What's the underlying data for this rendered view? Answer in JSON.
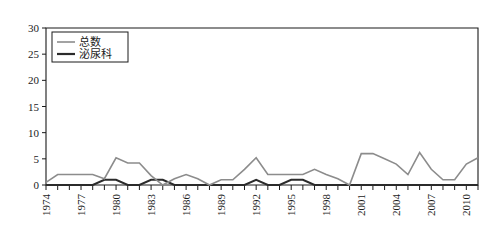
{
  "chart_data": {
    "type": "line",
    "title": "",
    "xlabel": "",
    "ylabel": "",
    "ylim": [
      0,
      30
    ],
    "ytick_values": [
      0,
      5,
      10,
      15,
      20,
      25,
      30
    ],
    "grid": false,
    "legend_position": "top-left",
    "x": [
      1974,
      1975,
      1976,
      1977,
      1978,
      1979,
      1980,
      1981,
      1982,
      1983,
      1984,
      1985,
      1986,
      1987,
      1988,
      1989,
      1990,
      1991,
      1992,
      1993,
      1994,
      1995,
      1996,
      1997,
      1998,
      1999,
      2000,
      2001,
      2002,
      2003,
      2004,
      2005,
      2006,
      2007,
      2008,
      2009,
      2010,
      2011
    ],
    "xtick_labels": [
      "1974",
      "1977",
      "1980",
      "1983",
      "1986",
      "1989",
      "1992",
      "1995",
      "1998",
      "2001",
      "2004",
      "2007",
      "2010"
    ],
    "xtick_label_years": [
      1974,
      1977,
      1980,
      1983,
      1986,
      1989,
      1992,
      1995,
      1998,
      2001,
      2004,
      2007,
      2010
    ],
    "series": [
      {
        "name": "总数",
        "color": "#8c8c8c",
        "width": 1.6,
        "values": [
          0,
          2,
          2,
          2,
          2,
          1,
          5,
          4,
          4,
          2,
          0,
          1,
          2,
          1,
          0,
          1,
          1,
          3,
          5,
          2,
          2,
          2,
          2,
          3,
          2,
          1,
          0,
          6,
          6,
          5,
          4,
          2,
          6,
          3,
          1,
          1,
          4,
          5
        ]
      },
      {
        "name": "泌尿科",
        "color": "#2b2b2b",
        "width": 2.0,
        "values": [
          0,
          0,
          0,
          0,
          0,
          1,
          1,
          0,
          0,
          1,
          1,
          0,
          0,
          0,
          0,
          0,
          0,
          0,
          1,
          0,
          0,
          1,
          1,
          0,
          0,
          0,
          0,
          0,
          0,
          0,
          0,
          0,
          0,
          0,
          0,
          0,
          0,
          0
        ]
      }
    ],
    "series_full": [
      {
        "name": "总数",
        "color": "#8c8c8c",
        "width": 1.6,
        "values": [
          0.6,
          2.0,
          2.0,
          2.1,
          2.0,
          1.2,
          5.2,
          4.3,
          4.2,
          1.9,
          0.1,
          1.1,
          2.0,
          1.1,
          0.2,
          1.0,
          1.1,
          3.1,
          5.4,
          2.1,
          2.0,
          2.1,
          2.0,
          3.1,
          2.1,
          1.2,
          0.1,
          6.2,
          6.1,
          5.0,
          4.0,
          2.2,
          6.4,
          3.0,
          1.1,
          1.0,
          4.2,
          5.4
        ]
      }
    ],
    "total_series_points": [
      {
        "year": 1974,
        "value": 0.5
      },
      {
        "year": 1975,
        "value": 2.0
      },
      {
        "year": 1976,
        "value": 2.0
      },
      {
        "year": 1977,
        "value": 2.0
      },
      {
        "year": 1978,
        "value": 2.0
      },
      {
        "year": 1979,
        "value": 1.2
      },
      {
        "year": 1980,
        "value": 5.2
      },
      {
        "year": 1981,
        "value": 4.2
      },
      {
        "year": 1982,
        "value": 4.2
      },
      {
        "year": 1983,
        "value": 1.8
      },
      {
        "year": 1984,
        "value": 0.0
      },
      {
        "year": 1985,
        "value": 1.2
      },
      {
        "year": 1986,
        "value": 2.0
      },
      {
        "year": 1987,
        "value": 1.2
      },
      {
        "year": 1988,
        "value": 0.0
      },
      {
        "year": 1989,
        "value": 1.0
      },
      {
        "year": 1990,
        "value": 1.0
      },
      {
        "year": 1991,
        "value": 3.0
      },
      {
        "year": 1992,
        "value": 5.2
      },
      {
        "year": 1993,
        "value": 2.0
      },
      {
        "year": 1994,
        "value": 2.0
      },
      {
        "year": 1995,
        "value": 2.0
      },
      {
        "year": 1996,
        "value": 2.0
      },
      {
        "year": 1997,
        "value": 3.0
      },
      {
        "year": 1998,
        "value": 2.0
      },
      {
        "year": 1999,
        "value": 1.2
      },
      {
        "year": 2000,
        "value": 0.0
      },
      {
        "year": 2001,
        "value": 6.0
      },
      {
        "year": 2002,
        "value": 6.0
      },
      {
        "year": 2003,
        "value": 5.0
      },
      {
        "year": 2004,
        "value": 4.0
      },
      {
        "year": 2005,
        "value": 2.0
      },
      {
        "year": 2006,
        "value": 6.2
      },
      {
        "year": 2007,
        "value": 3.0
      },
      {
        "year": 2008,
        "value": 1.0
      },
      {
        "year": 2009,
        "value": 1.0
      },
      {
        "year": 2010,
        "value": 4.0
      },
      {
        "year": 2011,
        "value": 5.2
      }
    ]
  },
  "legend": {
    "items": [
      {
        "label": "总数",
        "color": "#8c8c8c"
      },
      {
        "label": "泌尿科",
        "color": "#2b2b2b"
      }
    ]
  },
  "axes": {
    "y_labels": [
      "0",
      "5",
      "10",
      "15",
      "20",
      "25",
      "30"
    ],
    "x_labels": [
      "1974",
      "1977",
      "1980",
      "1983",
      "1986",
      "1989",
      "1992",
      "1995",
      "1998",
      "2001",
      "2004",
      "2007",
      "2010"
    ]
  }
}
